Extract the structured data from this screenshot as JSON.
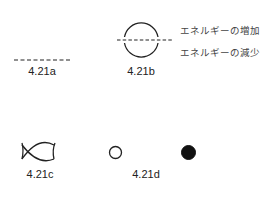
{
  "figures": {
    "a": {
      "label": "4.21a",
      "symbol": "dashed-line"
    },
    "b": {
      "label": "4.21b",
      "symbol": "circle-with-dashed-axis",
      "annotations": {
        "upper": "エネルギーの増加",
        "lower": "エネルギーの減少"
      }
    },
    "c": {
      "label": "4.21c",
      "symbol": "crossing-arcs"
    },
    "d": {
      "label": "4.21d",
      "symbols": [
        "open-circle",
        "filled-circle"
      ]
    }
  },
  "colors": {
    "stroke": "#222222",
    "text": "#222222",
    "annotation": "#444444",
    "background": "#ffffff"
  }
}
